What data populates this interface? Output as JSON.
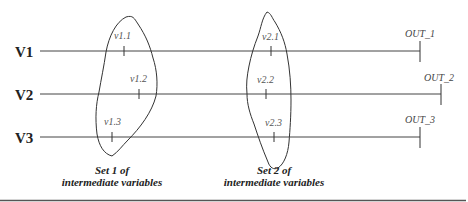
{
  "rows": [
    {
      "label": "V1",
      "output": "OUT_1"
    },
    {
      "label": "V2",
      "output": "OUT_2"
    },
    {
      "label": "V3",
      "output": "OUT_3"
    }
  ],
  "sets": [
    {
      "caption_line1": "Set 1 of",
      "caption_line2": "intermediate variables",
      "variables": [
        "v1.1",
        "v1.2",
        "v1.3"
      ]
    },
    {
      "caption_line1": "Set 2 of",
      "caption_line2": "intermediate variables",
      "variables": [
        "v2.1",
        "v2.2",
        "v2.3"
      ]
    }
  ]
}
